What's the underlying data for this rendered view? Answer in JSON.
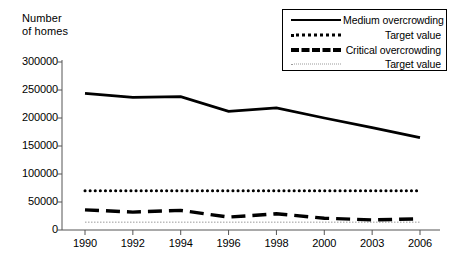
{
  "chart_data": {
    "type": "line",
    "title": "",
    "ylabel": "Number\nof homes",
    "xlabel": "",
    "categories": [
      "1990",
      "1992",
      "1994",
      "1996",
      "1998",
      "2000",
      "2003",
      "2006"
    ],
    "ylim": [
      0,
      300000
    ],
    "yticks": [
      0,
      50000,
      100000,
      150000,
      200000,
      250000,
      300000
    ],
    "ytick_labels": [
      "0",
      "50000",
      "100000",
      "150000",
      "200000",
      "250000",
      "300000"
    ],
    "grid": false,
    "legend_position": "top-right",
    "series": [
      {
        "name": "Medium overcrowding",
        "style": "solid",
        "values": [
          244000,
          237000,
          238000,
          212000,
          218000,
          200000,
          183000,
          165000
        ]
      },
      {
        "name": "Target value",
        "style": "dotted",
        "values": [
          70000,
          70000,
          70000,
          70000,
          70000,
          70000,
          70000,
          70000
        ]
      },
      {
        "name": "Critical overcrowding",
        "style": "dashed",
        "values": [
          36000,
          32000,
          35000,
          23000,
          29000,
          21000,
          18000,
          20000
        ]
      },
      {
        "name": "Target value",
        "style": "fine-dotted",
        "values": [
          14000,
          14000,
          14000,
          14000,
          14000,
          14000,
          14000,
          14000
        ]
      }
    ]
  },
  "legend": {
    "items": [
      {
        "label": "Medium overcrowding",
        "icon": "solid-line-icon"
      },
      {
        "label": "Target value",
        "icon": "dotted-line-icon"
      },
      {
        "label": "Critical overcrowding",
        "icon": "dashed-line-icon"
      },
      {
        "label": "Target value",
        "icon": "fine-dotted-line-icon"
      }
    ]
  },
  "axes": {
    "y_title": "Number\nof homes",
    "y_labels": [
      "300000",
      "250000",
      "200000",
      "150000",
      "100000",
      "50000",
      "0"
    ],
    "x_labels": [
      "1990",
      "1992",
      "1994",
      "1996",
      "1998",
      "2000",
      "2003",
      "2006"
    ]
  },
  "colors": {
    "line": "#000000",
    "faint": "#9a9a9a",
    "background": "#ffffff"
  }
}
